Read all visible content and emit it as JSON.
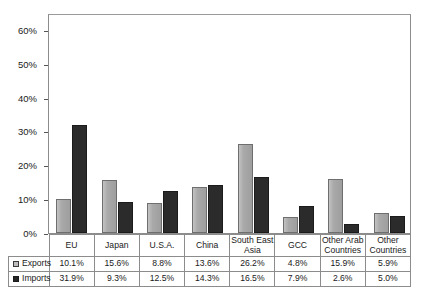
{
  "chart_data": {
    "type": "bar",
    "title": "",
    "subtitle": "",
    "xlabel": "",
    "ylabel": "",
    "ylim": [
      0,
      65
    ],
    "grid": false,
    "legend_position": "table-row-header",
    "y_ticks": [
      "0%",
      "10%",
      "20%",
      "30%",
      "40%",
      "50%",
      "60%"
    ],
    "y_tick_values": [
      0,
      10,
      20,
      30,
      40,
      50,
      60
    ],
    "categories": [
      "EU",
      "Japan",
      "U.S.A.",
      "China",
      "South East Asia",
      "GCC",
      "Other Arab Countries",
      "Other Countries"
    ],
    "category_lines": [
      [
        "EU"
      ],
      [
        "Japan"
      ],
      [
        "U.S.A."
      ],
      [
        "China"
      ],
      [
        "South East",
        "Asia"
      ],
      [
        "GCC"
      ],
      [
        "Other Arab",
        "Countries"
      ],
      [
        "Other",
        "Countries"
      ]
    ],
    "series": [
      {
        "name": "Exports",
        "color": "#a9a9a9",
        "values": [
          10.1,
          15.6,
          8.8,
          13.6,
          26.2,
          4.8,
          15.9,
          5.9
        ],
        "labels": [
          "10.1%",
          "15.6%",
          "8.8%",
          "13.6%",
          "26.2%",
          "4.8%",
          "15.9%",
          "5.9%"
        ]
      },
      {
        "name": "Imports",
        "color": "#2b2b2b",
        "values": [
          31.9,
          9.3,
          12.5,
          14.3,
          16.5,
          7.9,
          2.6,
          5.0
        ],
        "labels": [
          "31.9%",
          "9.3%",
          "12.5%",
          "14.3%",
          "16.5%",
          "7.9%",
          "2.6%",
          "5.0%"
        ]
      }
    ]
  }
}
